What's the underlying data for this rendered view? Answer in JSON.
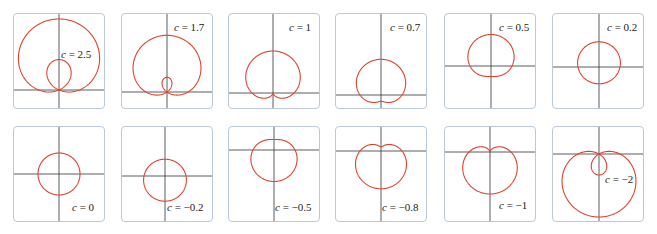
{
  "chart_data": {
    "type": "line",
    "title": "",
    "subtitle": "",
    "equation": "r = 1 + c sin θ",
    "grid": false,
    "legend": "none",
    "axis_color": "#333333",
    "curve_color": "#e0412d",
    "panels": [
      {
        "c": 2.5,
        "label": "c = 2.5",
        "row": 0,
        "col": 0,
        "box": [
          13,
          13
        ],
        "origin": [
          45,
          76
        ],
        "scale": 20.3,
        "label_pos": [
          47,
          34
        ]
      },
      {
        "c": 1.7,
        "label": "c = 1.7",
        "row": 0,
        "col": 1,
        "box": [
          121,
          13
        ],
        "origin": [
          45,
          78
        ],
        "scale": 21,
        "label_pos": [
          52,
          7
        ]
      },
      {
        "c": 1,
        "label": "c = 1",
        "row": 0,
        "col": 2,
        "box": [
          228,
          13
        ],
        "origin": [
          44,
          79
        ],
        "scale": 21,
        "label_pos": [
          60,
          7
        ]
      },
      {
        "c": 0.7,
        "label": "c = 0.7",
        "row": 0,
        "col": 3,
        "box": [
          335,
          13
        ],
        "origin": [
          45,
          81
        ],
        "scale": 21,
        "label_pos": [
          54,
          7
        ]
      },
      {
        "c": 0.5,
        "label": "c = 0.5",
        "row": 0,
        "col": 4,
        "box": [
          444,
          13
        ],
        "origin": [
          46,
          52
        ],
        "scale": 21,
        "label_pos": [
          54,
          7
        ]
      },
      {
        "c": 0.2,
        "label": "c = 0.2",
        "row": 0,
        "col": 5,
        "box": [
          552,
          13
        ],
        "origin": [
          46,
          53
        ],
        "scale": 21,
        "label_pos": [
          54,
          7
        ]
      },
      {
        "c": 0,
        "label": "c = 0",
        "row": 1,
        "col": 0,
        "box": [
          13,
          126
        ],
        "origin": [
          45,
          47
        ],
        "scale": 21,
        "label_pos": [
          58,
          74
        ]
      },
      {
        "c": -0.2,
        "label": "c = −0.2",
        "row": 1,
        "col": 1,
        "box": [
          121,
          126
        ],
        "origin": [
          43,
          49
        ],
        "scale": 21,
        "label_pos": [
          45,
          74
        ]
      },
      {
        "c": -0.5,
        "label": "c = −0.5",
        "row": 1,
        "col": 2,
        "box": [
          228,
          126
        ],
        "origin": [
          45,
          23
        ],
        "scale": 21,
        "label_pos": [
          46,
          74
        ]
      },
      {
        "c": -0.8,
        "label": "c = −0.8",
        "row": 1,
        "col": 3,
        "box": [
          335,
          126
        ],
        "origin": [
          45,
          24
        ],
        "scale": 21,
        "label_pos": [
          46,
          74
        ]
      },
      {
        "c": -1,
        "label": "c = −1",
        "row": 1,
        "col": 4,
        "box": [
          444,
          126
        ],
        "origin": [
          45,
          25
        ],
        "scale": 21,
        "label_pos": [
          54,
          72
        ]
      },
      {
        "c": -2,
        "label": "c = −2",
        "row": 1,
        "col": 5,
        "box": [
          552,
          126
        ],
        "origin": [
          46,
          27
        ],
        "scale": 21,
        "label_pos": [
          52,
          46
        ]
      }
    ]
  }
}
